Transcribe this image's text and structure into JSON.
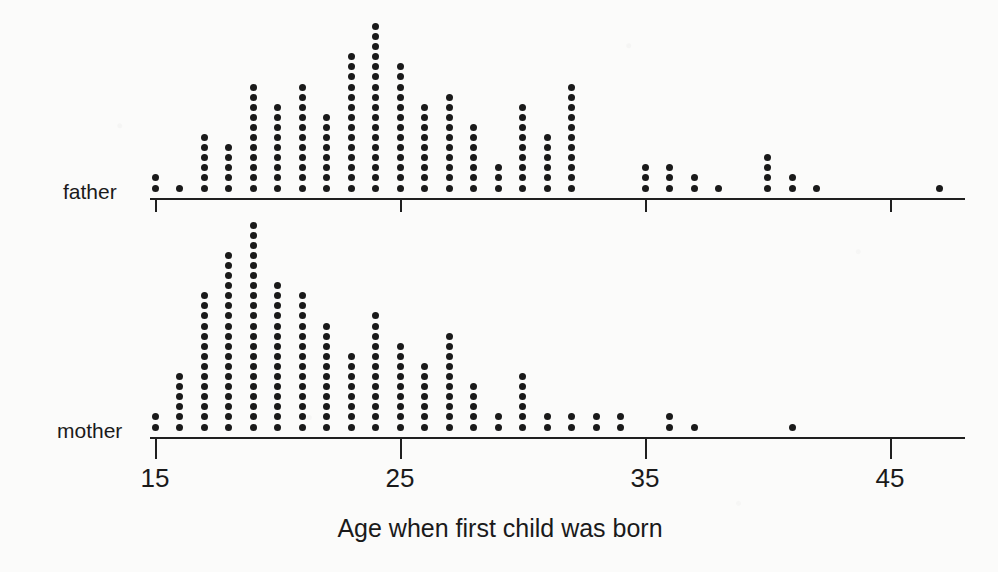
{
  "chart_data": {
    "type": "scatter",
    "plot_style": "dot-plot",
    "title": "",
    "xlabel": "Age when first child was born",
    "ylabel": "",
    "xlim": [
      14,
      48.5
    ],
    "xticks": [
      15,
      25,
      35,
      45
    ],
    "xtick_labels": [
      "15",
      "25",
      "35",
      "45"
    ],
    "grid": false,
    "legend_position": "none",
    "dot_unit": "1 person per dot",
    "panels": [
      {
        "name": "father",
        "label": "father",
        "x": [
          15,
          16,
          17,
          18,
          19,
          20,
          21,
          22,
          23,
          24,
          25,
          26,
          27,
          28,
          29,
          30,
          31,
          32,
          35,
          36,
          37,
          38,
          40,
          41,
          42,
          47
        ],
        "counts": [
          2,
          1,
          6,
          5,
          11,
          9,
          11,
          8,
          14,
          17,
          13,
          9,
          10,
          7,
          3,
          9,
          6,
          11,
          3,
          3,
          2,
          1,
          4,
          2,
          1,
          1
        ]
      },
      {
        "name": "mother",
        "label": "mother",
        "x": [
          15,
          16,
          17,
          18,
          19,
          20,
          21,
          22,
          23,
          24,
          25,
          26,
          27,
          28,
          29,
          30,
          31,
          32,
          33,
          34,
          36,
          37,
          41
        ],
        "counts": [
          2,
          6,
          14,
          18,
          21,
          15,
          14,
          11,
          8,
          12,
          9,
          7,
          10,
          5,
          2,
          6,
          2,
          2,
          2,
          2,
          2,
          1,
          1
        ]
      }
    ]
  },
  "axis": {
    "title": "Age when first child was born",
    "tick_labels": [
      "15",
      "25",
      "35",
      "45"
    ]
  },
  "panels": {
    "father_label": "father",
    "mother_label": "mother"
  },
  "colors": {
    "ink": "#1a1a1a",
    "background": "#fbfbfa"
  }
}
